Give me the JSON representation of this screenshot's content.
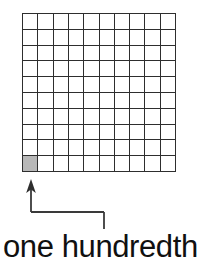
{
  "figure": {
    "title": "one hundredth",
    "caption": "one hundredth",
    "background_color": "#ffffff",
    "line_color": "#2e2e2e",
    "shade_color": "#b8b8b8",
    "text_color": "#101010"
  },
  "grid": {
    "rows": 10,
    "columns": 10,
    "total_cells": 100,
    "shaded_cells": 1,
    "shaded_cell_row": 10,
    "shaded_cell_column": 1,
    "fraction_label": "1/100",
    "decimal_label": "0.01"
  },
  "annotation": {
    "arrow_label": "arrow pointing to shaded cell",
    "points_to": "bottom-left shaded square"
  },
  "chart_data": {
    "type": "heatmap",
    "title": "one hundredth",
    "xlabel": "",
    "ylabel": "",
    "categories": [
      "1",
      "2",
      "3",
      "4",
      "5",
      "6",
      "7",
      "8",
      "9",
      "10"
    ],
    "rows": 10,
    "columns": 10,
    "values": [
      [
        0,
        0,
        0,
        0,
        0,
        0,
        0,
        0,
        0,
        0
      ],
      [
        0,
        0,
        0,
        0,
        0,
        0,
        0,
        0,
        0,
        0
      ],
      [
        0,
        0,
        0,
        0,
        0,
        0,
        0,
        0,
        0,
        0
      ],
      [
        0,
        0,
        0,
        0,
        0,
        0,
        0,
        0,
        0,
        0
      ],
      [
        0,
        0,
        0,
        0,
        0,
        0,
        0,
        0,
        0,
        0
      ],
      [
        0,
        0,
        0,
        0,
        0,
        0,
        0,
        0,
        0,
        0
      ],
      [
        0,
        0,
        0,
        0,
        0,
        0,
        0,
        0,
        0,
        0
      ],
      [
        0,
        0,
        0,
        0,
        0,
        0,
        0,
        0,
        0,
        0
      ],
      [
        0,
        0,
        0,
        0,
        0,
        0,
        0,
        0,
        0,
        0
      ],
      [
        1,
        0,
        0,
        0,
        0,
        0,
        0,
        0,
        0,
        0
      ]
    ],
    "shaded_count": 1,
    "total_count": 100,
    "fraction_shaded": 0.01,
    "grid": true,
    "legend": "none",
    "annotations": [
      "one hundredth"
    ]
  }
}
